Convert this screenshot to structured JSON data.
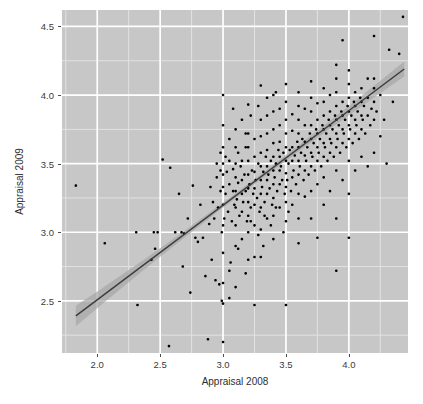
{
  "chart_data": {
    "type": "scatter",
    "title": "",
    "xlabel": "Appraisal 2008",
    "ylabel": "Appraisal 2009",
    "xlim": [
      1.72,
      4.47
    ],
    "ylim": [
      2.12,
      4.62
    ],
    "xticks": [
      2.0,
      2.5,
      3.0,
      3.5,
      4.0
    ],
    "xtick_labels": [
      "2.0",
      "2.5",
      "3.0",
      "3.5",
      "4.0"
    ],
    "yticks": [
      2.5,
      3.0,
      3.5,
      4.0,
      4.5
    ],
    "ytick_labels": [
      "2.5",
      "3.0",
      "3.5",
      "4.0",
      "4.5"
    ],
    "grid": true,
    "grid_major_color": "#ffffff",
    "grid_minor_color": "#e2e2e2",
    "panel_background": "#c7c7c7",
    "point_color": "#000000",
    "point_size": 2.6,
    "legend": "none",
    "fit": {
      "type": "linear",
      "line_color": "#3d3d3d",
      "band_color": "#a8a8a8",
      "x_start": 1.83,
      "x_end": 4.44,
      "y_start": 2.39,
      "y_end": 4.19,
      "slope": 0.6897,
      "intercept": 1.128,
      "band_halfwidth_start": 0.075,
      "band_halfwidth_mid": 0.018,
      "band_halfwidth_end": 0.055
    },
    "points": [
      [
        1.83,
        3.34
      ],
      [
        2.06,
        2.92
      ],
      [
        2.31,
        3.0
      ],
      [
        2.32,
        2.47
      ],
      [
        2.43,
        2.8
      ],
      [
        2.45,
        3.0
      ],
      [
        2.46,
        2.88
      ],
      [
        2.48,
        3.0
      ],
      [
        2.52,
        3.53
      ],
      [
        2.57,
        2.17
      ],
      [
        2.58,
        3.47
      ],
      [
        2.62,
        3.0
      ],
      [
        2.65,
        3.28
      ],
      [
        2.67,
        3.0
      ],
      [
        2.68,
        2.75
      ],
      [
        2.69,
        2.99
      ],
      [
        2.72,
        3.1
      ],
      [
        2.74,
        2.56
      ],
      [
        2.76,
        3.34
      ],
      [
        2.78,
        2.96
      ],
      [
        2.8,
        2.93
      ],
      [
        2.82,
        3.2
      ],
      [
        2.84,
        2.96
      ],
      [
        2.86,
        2.68
      ],
      [
        2.88,
        2.22
      ],
      [
        2.89,
        3.06
      ],
      [
        2.9,
        3.33
      ],
      [
        2.91,
        2.8
      ],
      [
        2.92,
        3.22
      ],
      [
        2.93,
        3.1
      ],
      [
        2.94,
        2.65
      ],
      [
        2.95,
        3.4
      ],
      [
        2.96,
        3.18
      ],
      [
        2.97,
        2.62
      ],
      [
        2.98,
        3.3
      ],
      [
        2.98,
        3.45
      ],
      [
        2.99,
        2.5
      ],
      [
        2.99,
        3.0
      ],
      [
        3.0,
        4.0
      ],
      [
        3.0,
        2.2
      ],
      [
        3.0,
        2.63
      ],
      [
        3.0,
        2.85
      ],
      [
        3.0,
        3.05
      ],
      [
        3.0,
        3.2
      ],
      [
        3.0,
        3.33
      ],
      [
        3.0,
        3.42
      ],
      [
        3.0,
        3.5
      ],
      [
        3.0,
        3.62
      ],
      [
        3.01,
        3.1
      ],
      [
        3.02,
        3.28
      ],
      [
        3.03,
        3.44
      ],
      [
        3.04,
        3.15
      ],
      [
        3.05,
        3.35
      ],
      [
        3.05,
        3.52
      ],
      [
        3.06,
        2.78
      ],
      [
        3.07,
        3.08
      ],
      [
        3.08,
        3.3
      ],
      [
        3.08,
        3.46
      ],
      [
        3.09,
        3.2
      ],
      [
        3.1,
        2.6
      ],
      [
        3.1,
        2.9
      ],
      [
        3.1,
        3.05
      ],
      [
        3.1,
        3.18
      ],
      [
        3.1,
        3.3
      ],
      [
        3.1,
        3.4
      ],
      [
        3.1,
        3.5
      ],
      [
        3.1,
        3.62
      ],
      [
        3.1,
        3.75
      ],
      [
        3.11,
        3.24
      ],
      [
        3.12,
        3.36
      ],
      [
        3.13,
        3.12
      ],
      [
        3.14,
        3.48
      ],
      [
        3.15,
        2.95
      ],
      [
        3.15,
        3.15
      ],
      [
        3.15,
        3.28
      ],
      [
        3.15,
        3.38
      ],
      [
        3.15,
        3.52
      ],
      [
        3.16,
        3.22
      ],
      [
        3.17,
        3.42
      ],
      [
        3.18,
        3.3
      ],
      [
        3.19,
        3.08
      ],
      [
        3.2,
        2.8
      ],
      [
        3.2,
        3.0
      ],
      [
        3.2,
        3.12
      ],
      [
        3.2,
        3.22
      ],
      [
        3.2,
        3.32
      ],
      [
        3.2,
        3.42
      ],
      [
        3.2,
        3.52
      ],
      [
        3.2,
        3.62
      ],
      [
        3.2,
        3.72
      ],
      [
        3.2,
        3.93
      ],
      [
        3.21,
        3.35
      ],
      [
        3.22,
        3.18
      ],
      [
        3.23,
        3.45
      ],
      [
        3.24,
        3.28
      ],
      [
        3.25,
        2.47
      ],
      [
        3.25,
        3.05
      ],
      [
        3.25,
        3.2
      ],
      [
        3.25,
        3.32
      ],
      [
        3.25,
        3.44
      ],
      [
        3.25,
        3.55
      ],
      [
        3.25,
        3.68
      ],
      [
        3.26,
        3.38
      ],
      [
        3.27,
        3.25
      ],
      [
        3.28,
        3.5
      ],
      [
        3.29,
        3.15
      ],
      [
        3.3,
        2.82
      ],
      [
        3.3,
        3.02
      ],
      [
        3.3,
        3.18
      ],
      [
        3.3,
        3.28
      ],
      [
        3.3,
        3.38
      ],
      [
        3.3,
        3.48
      ],
      [
        3.3,
        3.58
      ],
      [
        3.3,
        3.7
      ],
      [
        3.3,
        3.82
      ],
      [
        3.3,
        4.07
      ],
      [
        3.31,
        3.33
      ],
      [
        3.32,
        3.44
      ],
      [
        3.33,
        3.22
      ],
      [
        3.34,
        3.55
      ],
      [
        3.35,
        3.1
      ],
      [
        3.35,
        3.28
      ],
      [
        3.35,
        3.38
      ],
      [
        3.35,
        3.48
      ],
      [
        3.35,
        3.6
      ],
      [
        3.35,
        3.72
      ],
      [
        3.35,
        3.85
      ],
      [
        3.36,
        3.42
      ],
      [
        3.37,
        3.32
      ],
      [
        3.38,
        3.52
      ],
      [
        3.39,
        3.2
      ],
      [
        3.4,
        2.95
      ],
      [
        3.4,
        3.12
      ],
      [
        3.4,
        3.25
      ],
      [
        3.4,
        3.35
      ],
      [
        3.4,
        3.45
      ],
      [
        3.4,
        3.55
      ],
      [
        3.4,
        3.65
      ],
      [
        3.4,
        3.75
      ],
      [
        3.4,
        3.88
      ],
      [
        3.4,
        4.0
      ],
      [
        3.41,
        3.4
      ],
      [
        3.42,
        3.5
      ],
      [
        3.43,
        3.3
      ],
      [
        3.44,
        3.6
      ],
      [
        3.45,
        3.18
      ],
      [
        3.45,
        3.35
      ],
      [
        3.45,
        3.45
      ],
      [
        3.45,
        3.55
      ],
      [
        3.45,
        3.66
      ],
      [
        3.45,
        3.78
      ],
      [
        3.45,
        3.9
      ],
      [
        3.46,
        3.48
      ],
      [
        3.47,
        3.38
      ],
      [
        3.48,
        3.58
      ],
      [
        3.49,
        3.28
      ],
      [
        3.5,
        2.47
      ],
      [
        3.5,
        3.08
      ],
      [
        3.5,
        3.22
      ],
      [
        3.5,
        3.33
      ],
      [
        3.5,
        3.43
      ],
      [
        3.5,
        3.52
      ],
      [
        3.5,
        3.62
      ],
      [
        3.5,
        3.72
      ],
      [
        3.5,
        3.82
      ],
      [
        3.5,
        3.95
      ],
      [
        3.5,
        4.08
      ],
      [
        3.51,
        3.38
      ],
      [
        3.52,
        3.5
      ],
      [
        3.53,
        3.6
      ],
      [
        3.54,
        3.3
      ],
      [
        3.55,
        3.2
      ],
      [
        3.55,
        3.4
      ],
      [
        3.55,
        3.52
      ],
      [
        3.55,
        3.62
      ],
      [
        3.55,
        3.74
      ],
      [
        3.55,
        3.86
      ],
      [
        3.56,
        3.45
      ],
      [
        3.57,
        3.56
      ],
      [
        3.58,
        3.35
      ],
      [
        3.59,
        3.66
      ],
      [
        3.6,
        2.92
      ],
      [
        3.6,
        3.1
      ],
      [
        3.6,
        3.28
      ],
      [
        3.6,
        3.42
      ],
      [
        3.6,
        3.52
      ],
      [
        3.6,
        3.62
      ],
      [
        3.6,
        3.72
      ],
      [
        3.6,
        3.82
      ],
      [
        3.6,
        3.92
      ],
      [
        3.6,
        4.02
      ],
      [
        3.61,
        3.48
      ],
      [
        3.62,
        3.58
      ],
      [
        3.63,
        3.68
      ],
      [
        3.64,
        3.38
      ],
      [
        3.65,
        3.26
      ],
      [
        3.65,
        3.45
      ],
      [
        3.65,
        3.56
      ],
      [
        3.65,
        3.66
      ],
      [
        3.65,
        3.78
      ],
      [
        3.65,
        3.9
      ],
      [
        3.66,
        3.52
      ],
      [
        3.67,
        3.62
      ],
      [
        3.68,
        3.42
      ],
      [
        3.69,
        3.72
      ],
      [
        3.7,
        3.1
      ],
      [
        3.7,
        3.3
      ],
      [
        3.7,
        3.48
      ],
      [
        3.7,
        3.58
      ],
      [
        3.7,
        3.68
      ],
      [
        3.7,
        3.78
      ],
      [
        3.7,
        3.88
      ],
      [
        3.7,
        3.98
      ],
      [
        3.7,
        4.1
      ],
      [
        3.71,
        3.55
      ],
      [
        3.72,
        3.65
      ],
      [
        3.73,
        3.45
      ],
      [
        3.74,
        3.75
      ],
      [
        3.75,
        2.96
      ],
      [
        3.75,
        3.35
      ],
      [
        3.75,
        3.52
      ],
      [
        3.75,
        3.62
      ],
      [
        3.75,
        3.72
      ],
      [
        3.75,
        3.82
      ],
      [
        3.75,
        3.94
      ],
      [
        3.76,
        3.58
      ],
      [
        3.77,
        3.68
      ],
      [
        3.78,
        3.48
      ],
      [
        3.79,
        3.78
      ],
      [
        3.8,
        3.2
      ],
      [
        3.8,
        3.4
      ],
      [
        3.8,
        3.55
      ],
      [
        3.8,
        3.65
      ],
      [
        3.8,
        3.75
      ],
      [
        3.8,
        3.85
      ],
      [
        3.8,
        3.95
      ],
      [
        3.8,
        4.05
      ],
      [
        3.81,
        3.62
      ],
      [
        3.82,
        3.72
      ],
      [
        3.83,
        3.52
      ],
      [
        3.84,
        3.82
      ],
      [
        3.85,
        3.3
      ],
      [
        3.85,
        3.58
      ],
      [
        3.85,
        3.68
      ],
      [
        3.85,
        3.78
      ],
      [
        3.85,
        3.88
      ],
      [
        3.85,
        4.0
      ],
      [
        3.86,
        3.65
      ],
      [
        3.87,
        3.75
      ],
      [
        3.88,
        3.55
      ],
      [
        3.89,
        3.85
      ],
      [
        3.9,
        2.72
      ],
      [
        3.9,
        3.1
      ],
      [
        3.9,
        3.45
      ],
      [
        3.9,
        3.62
      ],
      [
        3.9,
        3.72
      ],
      [
        3.9,
        3.82
      ],
      [
        3.9,
        3.92
      ],
      [
        3.9,
        4.02
      ],
      [
        3.9,
        4.12
      ],
      [
        3.9,
        4.22
      ],
      [
        3.91,
        3.68
      ],
      [
        3.92,
        3.78
      ],
      [
        3.93,
        3.58
      ],
      [
        3.94,
        3.88
      ],
      [
        3.95,
        3.38
      ],
      [
        3.95,
        3.65
      ],
      [
        3.95,
        3.75
      ],
      [
        3.95,
        3.85
      ],
      [
        3.95,
        3.95
      ],
      [
        3.95,
        4.4
      ],
      [
        3.96,
        3.72
      ],
      [
        3.97,
        3.82
      ],
      [
        3.98,
        3.62
      ],
      [
        3.99,
        3.92
      ],
      [
        4.0,
        2.96
      ],
      [
        4.0,
        3.28
      ],
      [
        4.0,
        3.52
      ],
      [
        4.0,
        3.68
      ],
      [
        4.0,
        3.78
      ],
      [
        4.0,
        3.88
      ],
      [
        4.0,
        3.98
      ],
      [
        4.0,
        4.08
      ],
      [
        4.0,
        4.18
      ],
      [
        4.01,
        3.75
      ],
      [
        4.02,
        3.85
      ],
      [
        4.03,
        3.65
      ],
      [
        4.04,
        3.95
      ],
      [
        4.05,
        3.45
      ],
      [
        4.05,
        3.72
      ],
      [
        4.05,
        3.82
      ],
      [
        4.05,
        3.92
      ],
      [
        4.05,
        4.02
      ],
      [
        4.06,
        3.78
      ],
      [
        4.07,
        3.88
      ],
      [
        4.08,
        3.68
      ],
      [
        4.09,
        3.98
      ],
      [
        4.1,
        3.55
      ],
      [
        4.1,
        3.75
      ],
      [
        4.1,
        3.85
      ],
      [
        4.1,
        3.95
      ],
      [
        4.1,
        4.05
      ],
      [
        4.11,
        3.82
      ],
      [
        4.12,
        3.92
      ],
      [
        4.13,
        3.72
      ],
      [
        4.15,
        3.48
      ],
      [
        4.15,
        3.85
      ],
      [
        4.15,
        3.98
      ],
      [
        4.15,
        4.12
      ],
      [
        4.17,
        3.78
      ],
      [
        4.18,
        3.9
      ],
      [
        4.2,
        3.58
      ],
      [
        4.2,
        3.82
      ],
      [
        4.2,
        3.95
      ],
      [
        4.2,
        4.05
      ],
      [
        4.2,
        4.12
      ],
      [
        4.2,
        4.43
      ],
      [
        4.22,
        3.88
      ],
      [
        4.25,
        3.7
      ],
      [
        4.25,
        4.0
      ],
      [
        4.28,
        3.82
      ],
      [
        4.3,
        3.5
      ],
      [
        4.32,
        4.33
      ],
      [
        4.35,
        3.95
      ],
      [
        4.4,
        4.3
      ],
      [
        4.43,
        4.57
      ],
      [
        3.05,
        2.72
      ],
      [
        3.12,
        2.88
      ],
      [
        3.18,
        3.62
      ],
      [
        3.22,
        3.08
      ],
      [
        3.28,
        2.98
      ],
      [
        3.33,
        3.12
      ],
      [
        3.38,
        3.05
      ],
      [
        3.42,
        3.18
      ],
      [
        3.48,
        3.0
      ],
      [
        3.52,
        3.15
      ],
      [
        3.05,
        3.68
      ],
      [
        3.12,
        3.58
      ],
      [
        3.18,
        3.72
      ],
      [
        3.02,
        3.55
      ],
      [
        2.98,
        3.58
      ],
      [
        3.15,
        3.82
      ],
      [
        3.22,
        3.85
      ],
      [
        3.28,
        3.92
      ],
      [
        3.35,
        3.98
      ],
      [
        3.42,
        4.02
      ],
      [
        3.08,
        3.9
      ],
      [
        2.95,
        3.5
      ],
      [
        3.0,
        3.78
      ],
      [
        3.18,
        2.7
      ],
      [
        3.25,
        2.82
      ],
      [
        3.32,
        2.9
      ],
      [
        3.05,
        2.52
      ],
      [
        3.0,
        2.48
      ]
    ]
  }
}
